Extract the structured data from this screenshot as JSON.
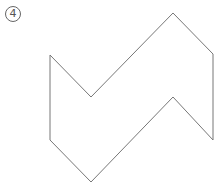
{
  "figure": {
    "label": "4",
    "shape": {
      "type": "polygon",
      "points": [
        [
          50,
          55
        ],
        [
          91,
          97
        ],
        [
          173,
          13
        ],
        [
          213,
          54
        ],
        [
          213,
          140
        ],
        [
          173,
          97
        ],
        [
          91,
          182
        ],
        [
          50,
          140
        ]
      ],
      "stroke": "#777777",
      "fill": "none"
    }
  }
}
